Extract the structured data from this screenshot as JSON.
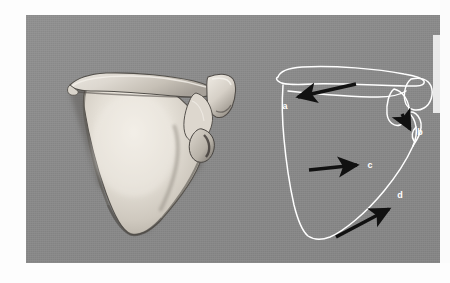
{
  "figure": {
    "kind": "anatomical-photo-plate",
    "background_color": "#8b8b8b",
    "page_color": "#fdfdfd",
    "outline_color": "#ffffff",
    "arrow_color": "#111111",
    "bone_light": "#e8e4dd",
    "bone_mid": "#cfc9c0",
    "bone_shadow": "#6e6a64",
    "panels": [
      {
        "name": "specimen-photograph",
        "caption": "",
        "description": "scapula bone specimen, posterior view"
      },
      {
        "name": "line-drawing-diagram",
        "caption": "",
        "description": "white outline tracing of the scapula with labelled arrows"
      }
    ],
    "labels": [
      {
        "id": "a",
        "text": "a",
        "x": 259,
        "y": 94,
        "points_to": "spine-of-scapula"
      },
      {
        "id": "b",
        "text": "b",
        "x": 394,
        "y": 117,
        "points_to": "glenoid-cavity"
      },
      {
        "id": "c",
        "text": "c",
        "x": 344,
        "y": 152,
        "points_to": "infraspinous-fossa"
      },
      {
        "id": "d",
        "text": "d",
        "x": 374,
        "y": 181,
        "points_to": "lateral-border"
      }
    ],
    "arrows": [
      {
        "id": "arrow-a",
        "label": "a",
        "from_x": 330,
        "from_y": 69,
        "to_x": 265,
        "to_y": 84
      },
      {
        "id": "arrow-b",
        "label": "b",
        "from_x": 376,
        "from_y": 99,
        "to_x": 386,
        "to_y": 119
      },
      {
        "id": "arrow-c",
        "label": "c",
        "from_x": 283,
        "from_y": 155,
        "to_x": 336,
        "to_y": 150
      },
      {
        "id": "arrow-d",
        "label": "d",
        "from_x": 310,
        "from_y": 222,
        "to_x": 367,
        "to_y": 192
      }
    ]
  }
}
